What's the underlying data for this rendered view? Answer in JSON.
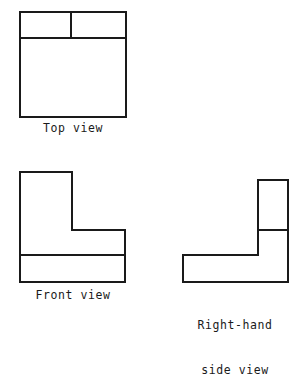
{
  "drawing": {
    "title": "Orthographic projection - three views of an L-shaped block",
    "background_color": "#ffffff",
    "line_color": "#1a1a1a",
    "views": [
      {
        "id": "top",
        "label": "Top view",
        "shape": "rectangle-with-divisions",
        "outline": "M 20 12 L 126 12 L 126 117 L 20 117 Z",
        "dividers": [
          {
            "name": "horizontal-divider",
            "x1": 20,
            "y1": 38,
            "x2": 126,
            "y2": 38
          },
          {
            "name": "vertical-divider",
            "x1": 71,
            "y1": 12,
            "x2": 71,
            "y2": 38
          }
        ]
      },
      {
        "id": "front",
        "label": "Front view",
        "shape": "L-shape-left",
        "outline": "M 20 172 L 72 172 L 72 230 L 125 230 L 125 282 L 20 282 Z",
        "dividers": [
          {
            "name": "horizontal-divider",
            "x1": 20,
            "y1": 255,
            "x2": 125,
            "y2": 255
          }
        ]
      },
      {
        "id": "right-hand-side",
        "label_line_1": "Right-hand",
        "label_line_2": "side view",
        "shape": "L-shape-right",
        "outline": "M 258 180 L 288 180 L 288 282 L 183 282 L 183 255 L 258 255 Z",
        "dividers": [
          {
            "name": "horizontal-divider",
            "x1": 258,
            "y1": 230,
            "x2": 288,
            "y2": 230
          }
        ]
      }
    ]
  }
}
